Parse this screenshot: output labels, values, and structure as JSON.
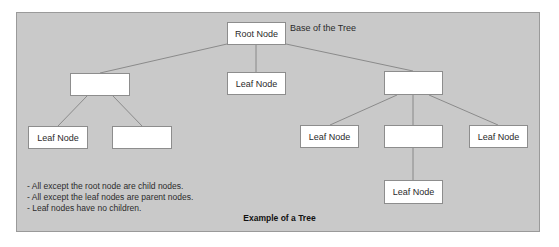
{
  "diagram": {
    "type": "tree",
    "title": "Example of a Tree",
    "annotation": "Base of the Tree",
    "colors": {
      "panel_bg": "#c9c9c9",
      "node_bg": "#ffffff",
      "edge": "#7a7a7a",
      "border": "#8d8d8d"
    },
    "nodes": {
      "root": {
        "label": "Root Node"
      },
      "left_parent": {
        "label": ""
      },
      "center_leaf": {
        "label": "Leaf Node"
      },
      "right_parent": {
        "label": ""
      },
      "left_leaf": {
        "label": "Leaf Node"
      },
      "left_blank": {
        "label": ""
      },
      "right_leaf_1": {
        "label": "Leaf Node"
      },
      "right_middle": {
        "label": ""
      },
      "right_leaf_2": {
        "label": "Leaf Node"
      },
      "bottom_leaf": {
        "label": "Leaf Node"
      }
    },
    "edges": [
      [
        "root",
        "left_parent"
      ],
      [
        "root",
        "center_leaf"
      ],
      [
        "root",
        "right_parent"
      ],
      [
        "left_parent",
        "left_leaf"
      ],
      [
        "left_parent",
        "left_blank"
      ],
      [
        "right_parent",
        "right_leaf_1"
      ],
      [
        "right_parent",
        "right_middle"
      ],
      [
        "right_parent",
        "right_leaf_2"
      ],
      [
        "right_middle",
        "bottom_leaf"
      ]
    ],
    "notes": [
      "- All except the root node are child nodes.",
      "- All except the leaf nodes are parent nodes.",
      "- Leaf nodes have no children."
    ]
  }
}
